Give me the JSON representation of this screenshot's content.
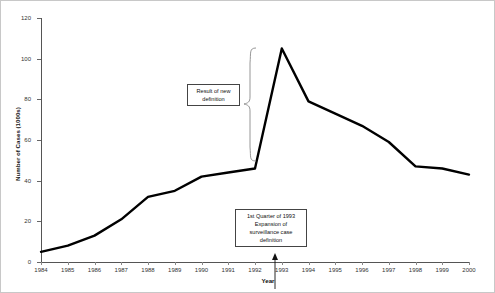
{
  "chart_data": {
    "type": "line",
    "title": "",
    "xlabel": "Year",
    "ylabel": "Number of Cases (1000s)",
    "categories": [
      "1984",
      "1985",
      "1986",
      "1987",
      "1988",
      "1989",
      "1990",
      "1991",
      "1992",
      "1993",
      "1994",
      "1995",
      "1996",
      "1997",
      "1998",
      "1999",
      "2000"
    ],
    "values": [
      5,
      8,
      13,
      21,
      32,
      35,
      42,
      44,
      46,
      105,
      79,
      73,
      67,
      59,
      47,
      46,
      43
    ],
    "ylim": [
      0,
      120
    ],
    "yticks": [
      0,
      20,
      40,
      60,
      80,
      100,
      120
    ],
    "ytick_labels": [
      "0",
      "20",
      "40",
      "60",
      "80",
      "100",
      "120"
    ],
    "grid": false,
    "legend": false,
    "line_color": "#000000",
    "axis_color": "#555555",
    "annotations": [
      {
        "id": "new-definition",
        "text": "Result of new definition",
        "lines": [
          "Result of new",
          "definition"
        ]
      },
      {
        "id": "expansion",
        "text": "1st Quarter of 1993 Expansion of surveillance case definition",
        "lines": [
          "1st Quarter of 1993",
          "Expansion of",
          "surveillance case",
          "definition"
        ]
      }
    ]
  },
  "axes": {
    "y_title": "Number of Cases (1000s)",
    "x_title": "Year"
  },
  "annotations": {
    "new_definition": {
      "line1": "Result of new",
      "line2": "definition"
    },
    "expansion": {
      "line1": "1st Quarter of 1993",
      "line2": "Expansion of",
      "line3": "surveillance case",
      "line4": "definition"
    }
  }
}
